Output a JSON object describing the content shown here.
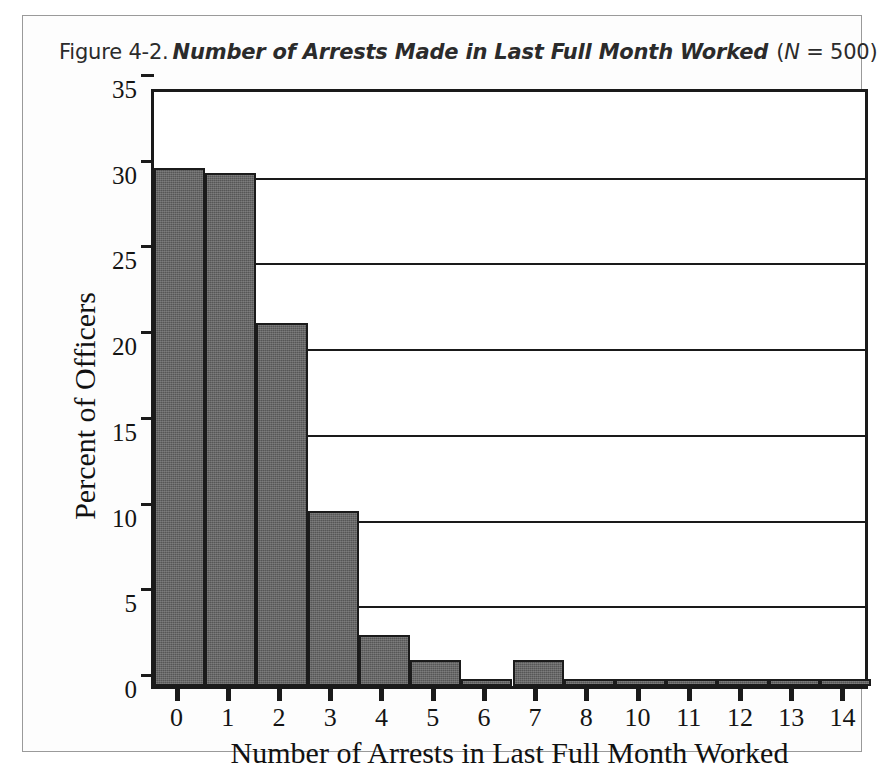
{
  "figure": {
    "label": "Figure 4-2.",
    "title": "Number of Arrests Made in Last Full Month Worked",
    "n_note_prefix": "(",
    "n_note_italic": "N",
    "n_note_suffix": " = 500)",
    "border_color": "#9a9a9a",
    "background": "#ffffff"
  },
  "chart_data": {
    "type": "bar",
    "title": "Number of Arrests Made in Last Full Month Worked",
    "subtitle": "Figure 4-2.",
    "annotation": "N = 500",
    "xlabel": "Number of Arrests in Last Full Month Worked",
    "ylabel": "Percent of Officers",
    "categories": [
      "0",
      "1",
      "2",
      "3",
      "4",
      "5",
      "6",
      "7",
      "8",
      "10",
      "11",
      "12",
      "13",
      "14"
    ],
    "values": [
      30.2,
      29.9,
      21.2,
      10.2,
      3.0,
      1.5,
      0.4,
      1.5,
      0.2,
      0.2,
      0.2,
      0.4,
      0.2,
      0.2
    ],
    "ylim": [
      0,
      35
    ],
    "yticks": [
      0,
      5,
      10,
      15,
      20,
      25,
      30,
      35
    ],
    "ytick_labels": [
      "0",
      "5",
      "10",
      "15",
      "20",
      "25",
      "30",
      "35"
    ],
    "grid": true,
    "grid_axis": "y",
    "legend": false,
    "bar_color": "#565656",
    "bar_edge_color": "#1b1b1b",
    "axis_color": "#1a1a1a"
  }
}
